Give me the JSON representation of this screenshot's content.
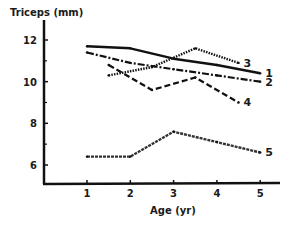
{
  "chart_data": {
    "type": "line",
    "title": "",
    "ylabel": "Triceps (mm)",
    "xlabel": "Age (yr)",
    "xlim": [
      0.1,
      5.5
    ],
    "ylim": [
      5,
      13
    ],
    "xticks": [
      1,
      2,
      3,
      4,
      5
    ],
    "yticks": [
      6,
      8,
      10,
      12
    ],
    "yminor_ticks": [
      7,
      9,
      11
    ],
    "grid": false,
    "legend": "inline labels at line ends",
    "series": [
      {
        "name": "1",
        "style": "solid",
        "x": [
          1,
          2,
          3,
          4,
          5
        ],
        "y": [
          11.7,
          11.6,
          11.1,
          10.8,
          10.4
        ]
      },
      {
        "name": "2",
        "style": "dash-dot",
        "x": [
          1,
          2,
          3,
          4,
          5
        ],
        "y": [
          11.4,
          10.9,
          10.6,
          10.3,
          10.0
        ]
      },
      {
        "name": "3",
        "style": "dotted",
        "x": [
          1.5,
          2.5,
          3.5,
          4.5
        ],
        "y": [
          10.3,
          10.7,
          11.6,
          10.9
        ]
      },
      {
        "name": "4",
        "style": "dashed",
        "x": [
          1.5,
          2.5,
          3.5,
          4.5
        ],
        "y": [
          10.8,
          9.6,
          10.2,
          9.0
        ]
      },
      {
        "name": "5",
        "style": "hatched",
        "x": [
          1,
          2,
          3,
          4,
          5
        ],
        "y": [
          6.4,
          6.4,
          7.6,
          7.1,
          6.6
        ]
      }
    ]
  }
}
